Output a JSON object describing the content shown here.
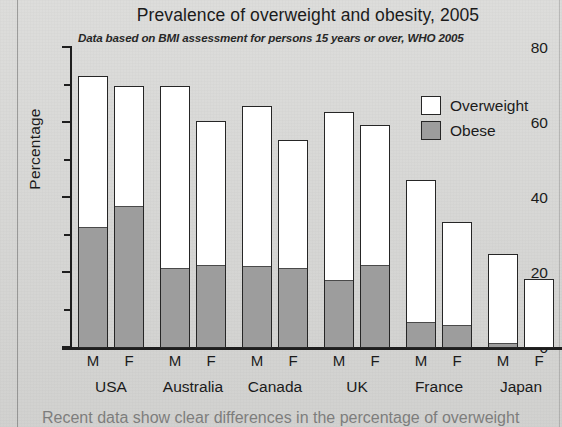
{
  "chart_data": {
    "type": "bar",
    "title": "Prevalence of overweight and obesity, 2005",
    "subtitle": "Data based on BMI assessment for persons 15 years or over, WHO 2005",
    "xlabel": "",
    "ylabel": "Percentage",
    "ylim": [
      0,
      80
    ],
    "yticks": [
      0,
      20,
      40,
      60,
      80
    ],
    "yticks_minor": [
      10,
      30,
      50,
      70
    ],
    "grid": false,
    "legend_position": "top-right",
    "stacked": true,
    "categories": [
      "USA M",
      "USA F",
      "Australia M",
      "Australia F",
      "Canada M",
      "Canada F",
      "UK M",
      "UK F",
      "France M",
      "France F",
      "Japan M",
      "Japan F"
    ],
    "groups": [
      {
        "country": "USA",
        "sexes": [
          "M",
          "F"
        ]
      },
      {
        "country": "Australia",
        "sexes": [
          "M",
          "F"
        ]
      },
      {
        "country": "Canada",
        "sexes": [
          "M",
          "F"
        ]
      },
      {
        "country": "UK",
        "sexes": [
          "M",
          "F"
        ]
      },
      {
        "country": "France",
        "sexes": [
          "M",
          "F"
        ]
      },
      {
        "country": "Japan",
        "sexes": [
          "M",
          "F"
        ]
      }
    ],
    "series": [
      {
        "name": "Overweight",
        "color": "#ffffff",
        "values": [
          72.5,
          70.0,
          70.0,
          60.5,
          64.5,
          55.5,
          63.0,
          59.5,
          44.8,
          33.5,
          25.0,
          18.5
        ]
      },
      {
        "name": "Obese",
        "color": "#9d9d9d",
        "values": [
          32.0,
          37.5,
          21.0,
          22.0,
          21.5,
          21.0,
          18.0,
          22.0,
          6.8,
          6.0,
          1.2,
          0.0
        ]
      }
    ],
    "bars": [
      {
        "country": "USA",
        "sex": "M",
        "overweight": 72.5,
        "obese": 32.0
      },
      {
        "country": "USA",
        "sex": "F",
        "overweight": 70.0,
        "obese": 37.5
      },
      {
        "country": "Australia",
        "sex": "M",
        "overweight": 70.0,
        "obese": 21.0
      },
      {
        "country": "Australia",
        "sex": "F",
        "overweight": 60.5,
        "obese": 22.0
      },
      {
        "country": "Canada",
        "sex": "M",
        "overweight": 64.5,
        "obese": 21.5
      },
      {
        "country": "Canada",
        "sex": "F",
        "overweight": 55.5,
        "obese": 21.0
      },
      {
        "country": "UK",
        "sex": "M",
        "overweight": 63.0,
        "obese": 18.0
      },
      {
        "country": "UK",
        "sex": "F",
        "overweight": 59.5,
        "obese": 22.0
      },
      {
        "country": "France",
        "sex": "M",
        "overweight": 44.8,
        "obese": 6.8
      },
      {
        "country": "France",
        "sex": "F",
        "overweight": 33.5,
        "obese": 6.0
      },
      {
        "country": "Japan",
        "sex": "M",
        "overweight": 25.0,
        "obese": 1.2
      },
      {
        "country": "Japan",
        "sex": "F",
        "overweight": 18.5,
        "obese": 0.0
      }
    ],
    "legend": [
      {
        "label": "Overweight",
        "color": "#ffffff"
      },
      {
        "label": "Obese",
        "color": "#9d9d9d"
      }
    ]
  },
  "caption": {
    "text": "Recent data show clear differences in the percentage of overweight"
  },
  "colors": {
    "page_background": "#d9d9d7",
    "bar_outline": "#262626",
    "overweight_fill": "#ffffff",
    "obese_fill": "#9d9d9d",
    "axis": "#1e1e1e",
    "text": "#1b1b1b"
  }
}
